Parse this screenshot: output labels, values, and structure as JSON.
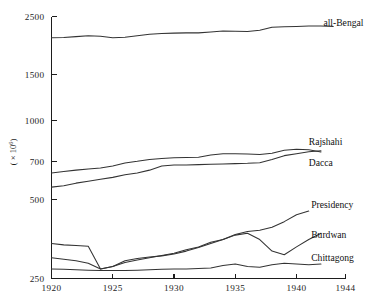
{
  "chart_data": {
    "type": "line",
    "title": "",
    "subtitle": "",
    "xlabel": "",
    "ylabel": "( × 10⁶ )",
    "ylabel_base": "( × 10",
    "ylabel_exp": "6",
    "ylabel_tail": ")",
    "yscale": "log",
    "xlim": [
      1920,
      1944
    ],
    "ylim": [
      250,
      2500
    ],
    "grid": false,
    "legend_position": "right-inline",
    "x_ticks": [
      1920,
      1925,
      1930,
      1935,
      1940,
      1944
    ],
    "x_tick_labels": [
      "1920",
      "1925",
      "1930",
      "1935",
      "1940",
      "1944"
    ],
    "y_ticks": [
      250,
      500,
      700,
      1000,
      1500,
      2500
    ],
    "y_tick_labels": [
      "250",
      "500",
      "700",
      "1000",
      "1500",
      "2500"
    ],
    "series": [
      {
        "name": "all-Bengal",
        "label": "all-Bengal",
        "color": "#333333",
        "label_x": 1942.2,
        "label_y": 2360,
        "x": [
          1920,
          1921,
          1922,
          1923,
          1924,
          1925,
          1926,
          1927,
          1928,
          1929,
          1930,
          1931,
          1932,
          1933,
          1934,
          1935,
          1936,
          1937,
          1938,
          1939,
          1940,
          1941,
          1942,
          1943
        ],
        "values": [
          2075,
          2080,
          2095,
          2110,
          2100,
          2075,
          2085,
          2110,
          2140,
          2155,
          2160,
          2165,
          2165,
          2180,
          2200,
          2195,
          2190,
          2215,
          2275,
          2285,
          2290,
          2300,
          2300,
          2290
        ]
      },
      {
        "name": "Rajshahi",
        "label": "Rajshahi",
        "color": "#333333",
        "label_x": 1941.0,
        "label_y": 830,
        "x": [
          1920,
          1921,
          1922,
          1923,
          1924,
          1925,
          1926,
          1927,
          1928,
          1929,
          1930,
          1931,
          1932,
          1933,
          1934,
          1935,
          1936,
          1937,
          1938,
          1939,
          1940,
          1941,
          1942
        ],
        "values": [
          632,
          640,
          648,
          655,
          660,
          672,
          690,
          700,
          712,
          718,
          722,
          724,
          726,
          740,
          748,
          748,
          746,
          744,
          752,
          772,
          778,
          775,
          760
        ]
      },
      {
        "name": "Dacca",
        "label": "Dacca",
        "color": "#333333",
        "label_x": 1941.0,
        "label_y": 690,
        "x": [
          1920,
          1921,
          1922,
          1923,
          1924,
          1925,
          1926,
          1927,
          1928,
          1929,
          1930,
          1931,
          1932,
          1933,
          1934,
          1935,
          1936,
          1937,
          1938,
          1939,
          1940,
          1941,
          1942
        ],
        "values": [
          558,
          565,
          578,
          588,
          598,
          608,
          622,
          632,
          648,
          672,
          678,
          678,
          680,
          682,
          684,
          686,
          688,
          692,
          712,
          736,
          748,
          762,
          768
        ]
      },
      {
        "name": "Presidency",
        "label": "Presidency",
        "color": "#333333",
        "label_x": 1941.2,
        "label_y": 480,
        "x": [
          1920,
          1921,
          1922,
          1923,
          1924,
          1925,
          1926,
          1927,
          1928,
          1929,
          1930,
          1931,
          1932,
          1933,
          1934,
          1935,
          1936,
          1937,
          1938,
          1939,
          1940,
          1941
        ],
        "values": [
          300,
          296,
          292,
          286,
          272,
          278,
          292,
          298,
          302,
          305,
          310,
          318,
          328,
          340,
          352,
          368,
          378,
          382,
          392,
          412,
          438,
          452
        ]
      },
      {
        "name": "Burdwan",
        "label": "Burdwan",
        "color": "#333333",
        "label_x": 1941.2,
        "label_y": 368,
        "x": [
          1920,
          1921,
          1922,
          1923,
          1924,
          1925,
          1926,
          1927,
          1928,
          1929,
          1930,
          1931,
          1932,
          1933,
          1934,
          1935,
          1936,
          1937,
          1938,
          1939,
          1940,
          1941,
          1942
        ],
        "values": [
          340,
          336,
          334,
          332,
          272,
          278,
          288,
          294,
          300,
          306,
          312,
          322,
          330,
          344,
          352,
          366,
          372,
          352,
          318,
          308,
          330,
          352,
          372
        ]
      },
      {
        "name": "Chittagong",
        "label": "Chittagong",
        "color": "#333333",
        "label_x": 1941.2,
        "label_y": 300,
        "x": [
          1920,
          1921,
          1922,
          1923,
          1924,
          1925,
          1926,
          1927,
          1928,
          1929,
          1930,
          1931,
          1932,
          1933,
          1934,
          1935,
          1936,
          1937,
          1938,
          1939,
          1940,
          1941,
          1942
        ],
        "values": [
          272,
          271,
          270,
          269,
          268,
          268,
          268,
          269,
          270,
          271,
          272,
          272,
          273,
          274,
          280,
          284,
          278,
          276,
          282,
          286,
          284,
          282,
          284
        ]
      }
    ]
  }
}
